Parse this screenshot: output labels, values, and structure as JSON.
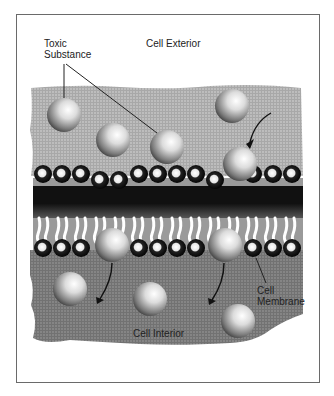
{
  "diagram": {
    "labels": {
      "toxic_line1": "Toxic",
      "toxic_line2": "Substance",
      "exterior": "Cell Exterior",
      "interior": "Cell Interior",
      "membrane_line1": "Cell",
      "membrane_line2": "Membrane"
    },
    "colors": {
      "exterior_fill": "#b4b4b4",
      "interior_fill": "#7e7e7e",
      "frame": "#6a6a6a",
      "sphere_highlight": "#ffffff",
      "sphere_shadow": "#3a3a3a",
      "lipid_head": "#111111"
    },
    "spheres_exterior": [
      {
        "cx": 64,
        "cy": 115,
        "r": 17
      },
      {
        "cx": 113,
        "cy": 140,
        "r": 17
      },
      {
        "cx": 167,
        "cy": 147,
        "r": 17
      },
      {
        "cx": 232,
        "cy": 106,
        "r": 17
      },
      {
        "cx": 240,
        "cy": 164,
        "r": 17
      }
    ],
    "spheres_membrane": [
      {
        "cx": 112,
        "cy": 245,
        "r": 17
      },
      {
        "cx": 225,
        "cy": 245,
        "r": 17
      }
    ],
    "spheres_interior": [
      {
        "cx": 70,
        "cy": 289,
        "r": 17
      },
      {
        "cx": 150,
        "cy": 299,
        "r": 17
      },
      {
        "cx": 238,
        "cy": 321,
        "r": 17
      }
    ]
  }
}
